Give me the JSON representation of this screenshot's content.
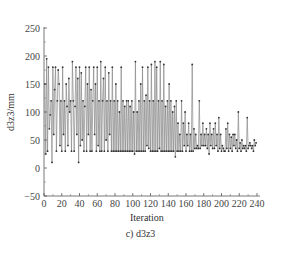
{
  "chart_data": {
    "type": "line",
    "title": "",
    "caption": "c) d3z3",
    "xlabel": "Iteration",
    "ylabel": "d3z3/mm",
    "xlim": [
      0,
      245
    ],
    "ylim": [
      -50,
      250
    ],
    "xticks": [
      0,
      20,
      40,
      60,
      80,
      100,
      120,
      140,
      160,
      180,
      200,
      220,
      240
    ],
    "yticks": [
      -50,
      0,
      50,
      100,
      150,
      200,
      250
    ],
    "grid": false,
    "legend": null,
    "markers": true,
    "series": [
      {
        "name": "d3z3",
        "color": "#555555",
        "values": [
          150,
          25,
          195,
          30,
          180,
          70,
          95,
          120,
          10,
          180,
          60,
          140,
          180,
          30,
          120,
          175,
          150,
          40,
          120,
          30,
          180,
          60,
          120,
          30,
          150,
          110,
          40,
          160,
          100,
          120,
          30,
          190,
          120,
          30,
          110,
          180,
          60,
          160,
          10,
          180,
          40,
          170,
          50,
          120,
          30,
          110,
          180,
          30,
          150,
          60,
          180,
          30,
          140,
          30,
          120,
          180,
          60,
          150,
          30,
          180,
          40,
          120,
          30,
          190,
          30,
          120,
          160,
          30,
          180,
          50,
          120,
          30,
          170,
          60,
          120,
          30,
          180,
          30,
          120,
          30,
          150,
          30,
          120,
          30,
          100,
          30,
          180,
          30,
          120,
          30,
          110,
          30,
          120,
          30,
          120,
          30,
          110,
          30,
          120,
          30,
          100,
          25,
          190,
          30,
          100,
          30,
          120,
          30,
          150,
          30,
          180,
          30,
          120,
          30,
          130,
          40,
          180,
          35,
          120,
          30,
          185,
          30,
          120,
          30,
          190,
          30,
          180,
          30,
          120,
          35,
          190,
          30,
          120,
          30,
          185,
          30,
          110,
          30,
          120,
          30,
          150,
          30,
          120,
          30,
          100,
          30,
          110,
          20,
          120,
          30,
          80,
          30,
          60,
          30,
          120,
          30,
          80,
          40,
          100,
          30,
          60,
          40,
          80,
          30,
          60,
          30,
          185,
          30,
          70,
          35,
          60,
          35,
          40,
          35,
          120,
          35,
          60,
          40,
          80,
          40,
          60,
          40,
          70,
          35,
          60,
          25,
          80,
          40,
          60,
          35,
          70,
          35,
          80,
          40,
          60,
          30,
          90,
          35,
          60,
          30,
          40,
          35,
          30,
          30,
          70,
          35,
          80,
          30,
          60,
          35,
          55,
          30,
          60,
          40,
          60,
          35,
          50,
          30,
          100,
          35,
          45,
          30,
          50,
          35,
          40,
          35,
          40,
          30,
          90,
          35,
          40,
          45,
          40,
          35,
          40,
          30,
          50,
          40,
          45
        ]
      }
    ]
  },
  "axes": {
    "x_tick_labels": [
      "0",
      "20",
      "40",
      "60",
      "80",
      "100",
      "120",
      "140",
      "160",
      "180",
      "200",
      "220",
      "240"
    ],
    "y_tick_labels": [
      "−50",
      "0",
      "50",
      "100",
      "150",
      "200",
      "250"
    ]
  }
}
